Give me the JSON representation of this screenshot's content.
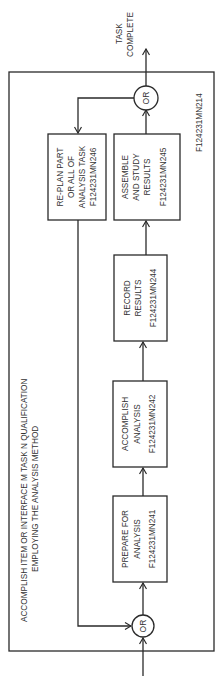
{
  "diagram": {
    "container": {
      "id_label": "F124231MN214",
      "title_lines": [
        "ACCOMPLISH ITEM OR INTERFACE M TASK N QUALIFICATION",
        "EMPLOYING THE ANALYSIS METHOD"
      ]
    },
    "output_label_lines": [
      "TASK",
      "COMPLETE"
    ],
    "gates": {
      "input_or": "OR",
      "output_or": "OR"
    },
    "boxes": [
      {
        "key": "prepare",
        "lines": [
          "PREPARE FOR",
          "ANALYSIS",
          "F124231MN241"
        ]
      },
      {
        "key": "accomplish",
        "lines": [
          "ACCOMPLISH",
          "ANALYSIS",
          "F124231MN242"
        ]
      },
      {
        "key": "record",
        "lines": [
          "RECORD",
          "RESULTS",
          "F124231MN244"
        ]
      },
      {
        "key": "assemble",
        "lines": [
          "ASSEMBLE",
          "AND STUDY",
          "RESULTS",
          "F124231MN245"
        ]
      },
      {
        "key": "replan",
        "lines": [
          "RE-PLAN PART",
          "OR ALL OF",
          "ANALYSIS TASK",
          "F124231MN246"
        ]
      }
    ]
  }
}
